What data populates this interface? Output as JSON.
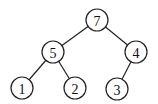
{
  "diagram": {
    "type": "binary-tree",
    "nodes": [
      {
        "id": "n7",
        "label": "7",
        "x": 97,
        "y": 20
      },
      {
        "id": "n5",
        "label": "5",
        "x": 53,
        "y": 52
      },
      {
        "id": "n4",
        "label": "4",
        "x": 136,
        "y": 52
      },
      {
        "id": "n1",
        "label": "1",
        "x": 22,
        "y": 88
      },
      {
        "id": "n2",
        "label": "2",
        "x": 75,
        "y": 88
      },
      {
        "id": "n3",
        "label": "3",
        "x": 117,
        "y": 89
      }
    ],
    "edges": [
      {
        "from": "n7",
        "to": "n5"
      },
      {
        "from": "n7",
        "to": "n4"
      },
      {
        "from": "n5",
        "to": "n1"
      },
      {
        "from": "n5",
        "to": "n2"
      },
      {
        "from": "n4",
        "to": "n3"
      }
    ],
    "node_radius": 11
  }
}
